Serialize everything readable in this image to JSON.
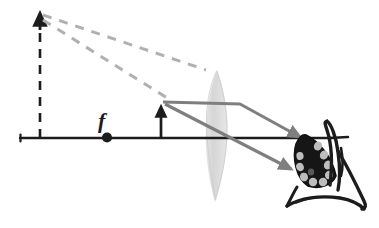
{
  "figure": {
    "domain": "physics-optics-ray-diagram",
    "width": 379,
    "height": 228,
    "background_color": "#ffffff"
  },
  "colors": {
    "ink_black": "#1c1c1c",
    "ray_gray": "#7f7f7f",
    "dashed_ray_gray": "#b0b0b0",
    "lens_fill": "#d8d8d8",
    "retina_dark": "#161616",
    "retina_segment": "#b8b8b8",
    "background": "#ffffff"
  },
  "labels": {
    "focal_point": "f"
  },
  "axis": {
    "name": "optical-axis",
    "y": 138,
    "x_start": 20,
    "x_end": 332
  },
  "object": {
    "name": "object-arrow",
    "x": 161,
    "base_y": 138,
    "tip_y": 102,
    "height_px": 36,
    "orientation": "upright"
  },
  "virtual_image": {
    "name": "virtual-image-arrow",
    "x": 40,
    "base_y": 138,
    "tip_y": 13,
    "height_px": 125,
    "orientation": "upright",
    "stem_style": "dashed"
  },
  "focal_point": {
    "name": "focal-point-marker",
    "x": 107,
    "y": 138,
    "label": "f",
    "label_x": 104,
    "label_y": 127
  },
  "lens": {
    "name": "converging-lens",
    "type": "biconvex",
    "center_x": 217,
    "top_y": 70,
    "bottom_y": 202,
    "half_width": 17
  },
  "rays": [
    {
      "name": "ray-parallel-to-axis",
      "style": "solid",
      "color": "ray_gray",
      "points": [
        [
          162,
          102
        ],
        [
          240,
          104
        ],
        [
          306,
          140
        ]
      ],
      "arrowhead_at": [
        306,
        140
      ]
    },
    {
      "name": "ray-through-lens-center",
      "style": "solid",
      "color": "ray_gray",
      "points": [
        [
          164,
          104
        ],
        [
          296,
          172
        ]
      ],
      "arrowhead_at": [
        296,
        172
      ]
    }
  ],
  "dashed_rays": [
    {
      "name": "backward-extension-upper",
      "style": "dashed",
      "color": "dashed_ray_gray",
      "from": [
        41,
        14
      ],
      "to": [
        205,
        70
      ]
    },
    {
      "name": "backward-extension-lower",
      "style": "dashed",
      "color": "dashed_ray_gray",
      "from": [
        42,
        17
      ],
      "to": [
        170,
        101
      ]
    }
  ],
  "eye": {
    "name": "observer-eye",
    "description": "stylized sketch of an eye with dark segmented retina receiving the converging rays",
    "center": [
      316,
      166
    ],
    "retina": {
      "name": "retina",
      "segment_count": 9,
      "fill": "#161616",
      "segment_fill": "#b8b8b8"
    }
  }
}
